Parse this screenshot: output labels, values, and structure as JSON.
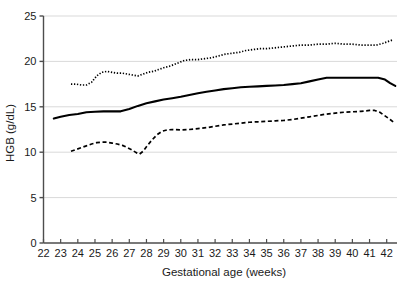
{
  "chart_data": {
    "type": "line",
    "title": "",
    "subtitle": "",
    "xlabel": "Gestational age (weeks)",
    "ylabel": "HGB (g/dL)",
    "xlim": [
      22,
      42.6
    ],
    "ylim": [
      0,
      25
    ],
    "xticks": [
      22,
      23,
      24,
      25,
      26,
      27,
      28,
      29,
      30,
      31,
      32,
      33,
      34,
      35,
      36,
      37,
      38,
      39,
      40,
      41,
      42
    ],
    "xticklabels": [
      "22",
      "23",
      "24",
      "25",
      "26",
      "27",
      "28",
      "29",
      "30",
      "31",
      "32",
      "33",
      "34",
      "35",
      "36",
      "37",
      "38",
      "39",
      "40",
      "41",
      "42"
    ],
    "yticks": [
      0,
      5,
      10,
      15,
      20,
      25
    ],
    "yticklabels": [
      "0",
      "5",
      "10",
      "15",
      "20",
      "25"
    ],
    "grid": "horizontal",
    "grid_color": "#d9d9d9",
    "axis_color": "#4d4d4d",
    "legend": "none",
    "legend_position": "none",
    "annotations": [],
    "series": [
      {
        "name": "upper percentile",
        "style": "dotted",
        "color": "#000000",
        "x": [
          23.6,
          23.9,
          24.2,
          24.5,
          24.8,
          25.1,
          25.4,
          25.7,
          26.0,
          26.3,
          26.6,
          26.9,
          27.2,
          27.5,
          27.8,
          28.1,
          28.4,
          28.7,
          29.0,
          29.4,
          29.8,
          30.2,
          30.6,
          31.0,
          31.4,
          31.8,
          32.2,
          32.6,
          33.0,
          33.4,
          33.8,
          34.2,
          34.6,
          35.0,
          35.5,
          36.0,
          36.5,
          37.0,
          37.5,
          38.0,
          38.5,
          39.0,
          39.5,
          40.0,
          40.5,
          41.0,
          41.4,
          41.8,
          42.1,
          42.4
        ],
        "y": [
          17.5,
          17.5,
          17.4,
          17.4,
          17.7,
          18.4,
          18.8,
          18.9,
          18.8,
          18.7,
          18.7,
          18.6,
          18.5,
          18.4,
          18.6,
          18.8,
          18.9,
          19.1,
          19.3,
          19.5,
          19.8,
          20.1,
          20.2,
          20.2,
          20.3,
          20.4,
          20.6,
          20.8,
          20.9,
          21.0,
          21.2,
          21.3,
          21.4,
          21.4,
          21.5,
          21.6,
          21.7,
          21.8,
          21.8,
          21.9,
          21.9,
          22.0,
          21.9,
          21.9,
          21.8,
          21.8,
          21.8,
          22.0,
          22.2,
          22.4
        ]
      },
      {
        "name": "median",
        "style": "solid",
        "color": "#000000",
        "x": [
          22.6,
          23.0,
          23.5,
          24.0,
          24.5,
          25.0,
          25.5,
          26.0,
          26.5,
          27.0,
          27.5,
          28.0,
          28.5,
          29.0,
          29.5,
          30.0,
          30.5,
          31.0,
          31.5,
          32.0,
          32.5,
          33.0,
          33.5,
          34.0,
          34.5,
          35.0,
          35.5,
          36.0,
          36.5,
          37.0,
          37.5,
          38.0,
          38.5,
          39.0,
          39.5,
          40.0,
          40.5,
          41.0,
          41.5,
          41.9,
          42.2,
          42.5
        ],
        "y": [
          13.7,
          13.9,
          14.1,
          14.2,
          14.4,
          14.45,
          14.5,
          14.5,
          14.5,
          14.75,
          15.1,
          15.4,
          15.6,
          15.8,
          15.95,
          16.1,
          16.3,
          16.5,
          16.65,
          16.8,
          16.95,
          17.05,
          17.15,
          17.2,
          17.25,
          17.3,
          17.35,
          17.4,
          17.5,
          17.6,
          17.8,
          18.0,
          18.2,
          18.2,
          18.2,
          18.2,
          18.2,
          18.2,
          18.2,
          18.0,
          17.6,
          17.3
        ]
      },
      {
        "name": "lower percentile",
        "style": "dashed",
        "color": "#000000",
        "x": [
          23.6,
          23.9,
          24.2,
          24.5,
          24.8,
          25.1,
          25.4,
          25.7,
          26.0,
          26.3,
          26.6,
          26.9,
          27.2,
          27.4,
          27.6,
          27.8,
          28.0,
          28.3,
          28.6,
          28.9,
          29.2,
          29.5,
          30.0,
          30.5,
          31.0,
          31.5,
          32.0,
          32.5,
          33.0,
          33.5,
          34.0,
          34.5,
          35.0,
          35.5,
          36.0,
          36.5,
          37.0,
          37.5,
          38.0,
          38.5,
          39.0,
          39.5,
          40.0,
          40.5,
          41.0,
          41.3,
          41.6,
          41.9,
          42.2,
          42.4
        ],
        "y": [
          10.1,
          10.3,
          10.5,
          10.7,
          10.9,
          11.05,
          11.1,
          11.1,
          11.0,
          10.9,
          10.75,
          10.5,
          10.2,
          9.95,
          9.8,
          10.1,
          10.6,
          11.3,
          11.9,
          12.3,
          12.45,
          12.5,
          12.45,
          12.5,
          12.6,
          12.7,
          12.85,
          13.0,
          13.1,
          13.2,
          13.3,
          13.35,
          13.4,
          13.45,
          13.5,
          13.6,
          13.75,
          13.9,
          14.05,
          14.2,
          14.3,
          14.4,
          14.45,
          14.5,
          14.6,
          14.6,
          14.4,
          14.0,
          13.6,
          13.3
        ]
      }
    ]
  }
}
